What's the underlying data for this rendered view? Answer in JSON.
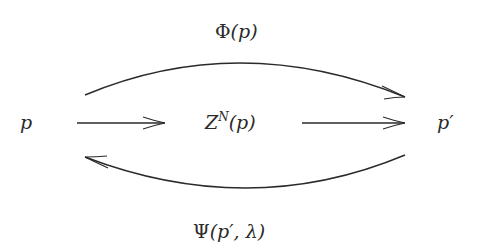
{
  "diagram": {
    "nodes": {
      "source": {
        "label": "p"
      },
      "middle": {
        "base": "Z",
        "superscript": "N",
        "arg": "(p)"
      },
      "target": {
        "label": "p′"
      }
    },
    "edges": {
      "top_arc": {
        "label_symbol": "Φ",
        "label_arg": "(p)",
        "from": "p",
        "to": "p′"
      },
      "bottom_arc": {
        "label_symbol": "Ψ",
        "label_arg": "(p′, λ)",
        "from": "p′",
        "to": "p"
      },
      "arrow_left": {
        "from": "p",
        "to": "Z^N(p)"
      },
      "arrow_right": {
        "from": "Z^N(p)",
        "to": "p′"
      }
    },
    "colors": {
      "stroke": "#2a2a2a",
      "background": "#ffffff"
    }
  }
}
